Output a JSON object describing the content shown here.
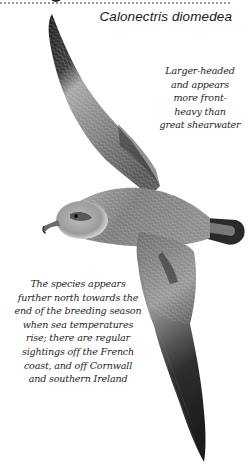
{
  "plate": {
    "species_title": "Calonectris diomedea",
    "illustration": {
      "subject": "Cory's shearwater in flight, dorsal view",
      "style": "grayscale pencil illustration"
    },
    "notes": [
      {
        "id": "note-head-shape",
        "lines": [
          "Larger-headed",
          "and appears",
          "more front-",
          "heavy than",
          "great shearwater"
        ]
      },
      {
        "id": "note-range",
        "lines": [
          "The species appears",
          "further north towards the",
          "end of the breeding season",
          "when sea temperatures",
          "rise; there are regular",
          "sightings off the French",
          "coast, and off Cornwall",
          "and southern Ireland"
        ]
      }
    ]
  },
  "colors": {
    "background": "#ffffff",
    "text": "#1a1a1a",
    "wing_dark": "#2b2b2b",
    "body_mid": "#8a8a8a",
    "head_light": "#c8c8c8",
    "dotted_rule": "#9a9a9a"
  }
}
